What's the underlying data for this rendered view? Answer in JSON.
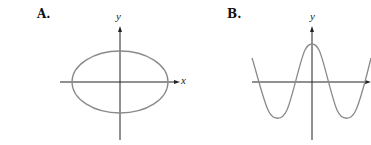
{
  "panels": [
    {
      "label": "A.",
      "shape": "ellipse",
      "x_axis_label": "x",
      "y_axis_label": "y"
    },
    {
      "label": "B.",
      "shape": "cosine-wave",
      "y_axis_label": "y"
    }
  ],
  "colors": {
    "axis": "#222222",
    "curve": "#8a8a8a",
    "text": "#111111"
  }
}
